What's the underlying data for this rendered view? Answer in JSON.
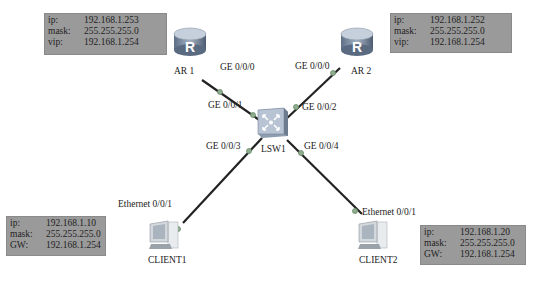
{
  "devices": {
    "ar1": {
      "name": "AR 1",
      "info": [
        {
          "k": "ip:",
          "v": "192.168.1.253"
        },
        {
          "k": "mask:",
          "v": "255.255.255.0"
        },
        {
          "k": "vip:",
          "v": "192.168.1.254"
        }
      ]
    },
    "ar2": {
      "name": "AR 2",
      "info": [
        {
          "k": "ip:",
          "v": "192.168.1.252"
        },
        {
          "k": "mask:",
          "v": "255.255.255.0"
        },
        {
          "k": "vip:",
          "v": "192.168.1.254"
        }
      ]
    },
    "lsw1": {
      "name": "LSW1"
    },
    "client1": {
      "name": "CLIENT1",
      "info": [
        {
          "k": "ip:",
          "v": "192.168.1.10"
        },
        {
          "k": "mask:",
          "v": "255.255.255.0"
        },
        {
          "k": "GW:",
          "v": "192.168.1.254"
        }
      ]
    },
    "client2": {
      "name": "CLIENT2",
      "info": [
        {
          "k": "ip:",
          "v": "192.168.1.20"
        },
        {
          "k": "mask:",
          "v": "255.255.255.0"
        },
        {
          "k": "GW:",
          "v": "192.168.1.254"
        }
      ]
    }
  },
  "ports": {
    "ar1_ge000": "GE 0/0/0",
    "ar2_ge000": "GE 0/0/0",
    "lsw_ge001": "GE 0/0/1",
    "lsw_ge002": "GE 0/0/2",
    "lsw_ge003": "GE 0/0/3",
    "lsw_ge004": "GE 0/0/4",
    "client1_eth": "Ethernet 0/0/1",
    "client2_eth": "Ethernet 0/0/1"
  },
  "colors": {
    "info_bg": "#9a9a9a",
    "link": "#222222",
    "port_dot": "#8fae8f"
  }
}
